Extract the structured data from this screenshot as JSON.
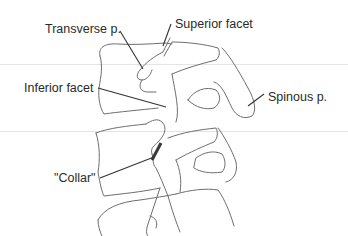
{
  "figure": {
    "colors": {
      "outline": "#6e6e6e",
      "leader": "#333333",
      "collar": "#3a3a3a",
      "text": "#2a2a2a",
      "guide_line": "#e4e4e4"
    },
    "labels": {
      "transverse_process": "Transverse p.",
      "superior_facet": "Superior facet",
      "inferior_facet": "Inferior facet",
      "spinous_process": "Spinous p.",
      "collar": "\"Collar\""
    }
  }
}
